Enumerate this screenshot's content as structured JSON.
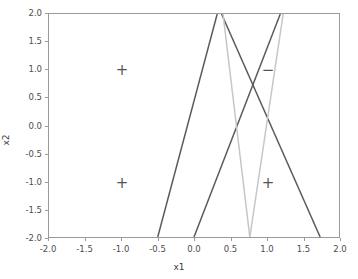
{
  "chart_data": {
    "type": "line",
    "title": "",
    "xlabel": "x1",
    "ylabel": "x2",
    "xlim": [
      -2.0,
      2.0
    ],
    "ylim": [
      -2.0,
      2.0
    ],
    "grid": false,
    "legend": "none",
    "xticks": [
      "-2.0",
      "-1.5",
      "-1.0",
      "-0.5",
      "0.0",
      "0.5",
      "1.0",
      "1.5",
      "2.0"
    ],
    "xtick_values": [
      -2.0,
      -1.5,
      -1.0,
      -0.5,
      0.0,
      0.5,
      1.0,
      1.5,
      2.0
    ],
    "yticks": [
      "-2.0",
      "-1.5",
      "-1.0",
      "-0.5",
      "0.0",
      "0.5",
      "1.0",
      "1.5",
      "2.0"
    ],
    "ytick_values": [
      -2.0,
      -1.5,
      -1.0,
      -0.5,
      0.0,
      0.5,
      1.0,
      1.5,
      2.0
    ],
    "series": [
      {
        "name": "boundary-1",
        "color": "#5a5a5a",
        "x": [
          -0.5,
          0.32
        ],
        "y": [
          -2.0,
          2.0
        ]
      },
      {
        "name": "boundary-2",
        "color": "#5a5a5a",
        "x": [
          0.0,
          1.19
        ],
        "y": [
          -2.0,
          2.0
        ]
      },
      {
        "name": "boundary-3",
        "color": "#5a5a5a",
        "x": [
          1.74,
          0.38
        ],
        "y": [
          -2.0,
          2.0
        ]
      },
      {
        "name": "boundary-4",
        "color": "#c6c6c6",
        "x": [
          0.77,
          0.4
        ],
        "y": [
          -2.0,
          2.0
        ]
      },
      {
        "name": "boundary-5",
        "color": "#c6c6c6",
        "x": [
          0.77,
          1.23
        ],
        "y": [
          -2.0,
          2.0
        ]
      }
    ],
    "points": [
      {
        "label": "+",
        "x": -1.0,
        "y": 1.0,
        "class": "positive"
      },
      {
        "label": "+",
        "x": -1.0,
        "y": -1.0,
        "class": "positive"
      },
      {
        "label": "−",
        "x": 1.0,
        "y": 1.0,
        "class": "negative"
      },
      {
        "label": "+",
        "x": 1.0,
        "y": -1.0,
        "class": "positive"
      }
    ],
    "colors": {
      "line_dark": "#5a5a5a",
      "line_light": "#c6c6c6",
      "marker": "#555555",
      "axis": "#9a9a9a",
      "text": "#4d4d4d",
      "background": "#ffffff"
    }
  }
}
